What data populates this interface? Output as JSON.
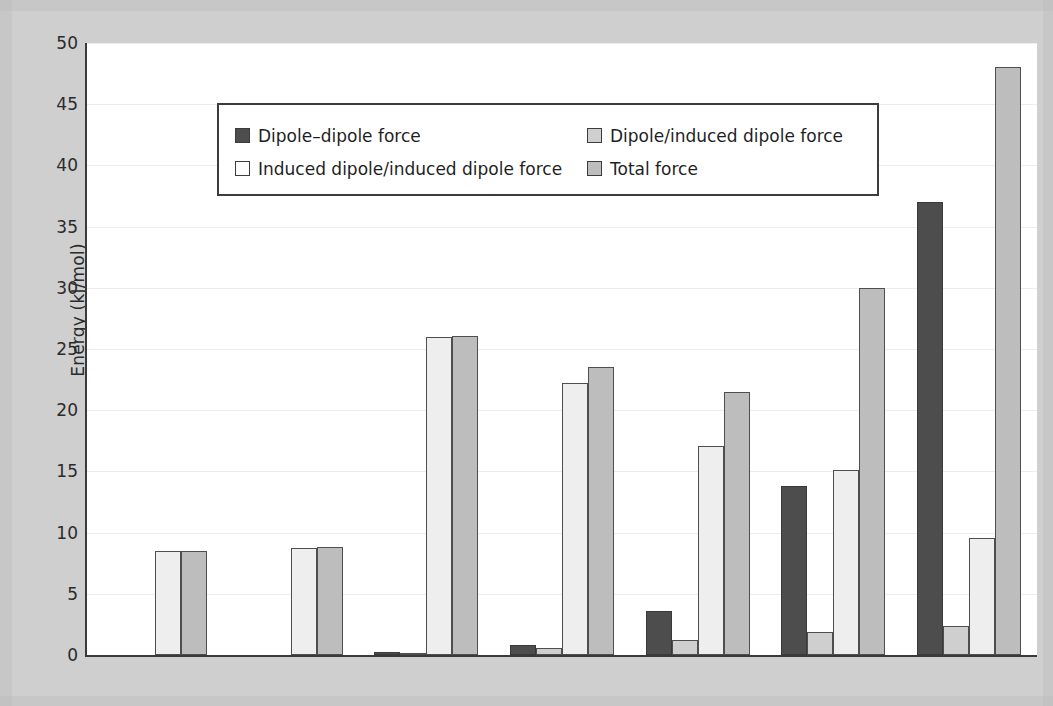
{
  "chart_data": {
    "type": "bar",
    "title": "",
    "xlabel": "",
    "ylabel": "Energy (kJ/mol)",
    "ylim": [
      0,
      50
    ],
    "ytick_step": 5,
    "yticks": [
      0,
      5,
      10,
      15,
      20,
      25,
      30,
      35,
      40,
      45,
      50
    ],
    "ytick_labels": [
      "0",
      "5",
      "10",
      "15",
      "20",
      "25",
      "30",
      "35",
      "40",
      "45",
      "50"
    ],
    "grid": true,
    "grid_axis": "y",
    "legend_position": "upper left",
    "categories": [
      "Ar",
      "CO",
      "HI",
      "HBr",
      "HCl",
      "NH3",
      "H2O"
    ],
    "category_labels_html": [
      "Ar",
      "CO",
      "HI",
      "HBr",
      "HCl",
      "NH<sub>3</sub>",
      "H<sub>2</sub>O"
    ],
    "series": [
      {
        "name": "Dipole–dipole force",
        "color": "#4d4d4d",
        "values": [
          null,
          null,
          0.1,
          0.8,
          3.6,
          13.8,
          37.0
        ]
      },
      {
        "name": "Dipole/induced dipole force",
        "color": "#cfcfcf",
        "values": [
          null,
          null,
          0.0,
          0.6,
          1.2,
          1.9,
          2.4
        ]
      },
      {
        "name": "Induced dipole/induced dipole force",
        "color": "#fdfdfd",
        "values": [
          8.5,
          8.75,
          26.0,
          22.2,
          17.1,
          15.1,
          9.6
        ]
      },
      {
        "name": "Total force",
        "color": "#bdbdbd",
        "values": [
          8.5,
          8.8,
          26.1,
          23.5,
          21.5,
          30.0,
          48.0
        ]
      }
    ]
  },
  "legend": {
    "entries": [
      {
        "label": "Dipole–dipole force",
        "swatch": "s0"
      },
      {
        "label": "Dipole/induced dipole force",
        "swatch": "s1"
      },
      {
        "label": "Induced dipole/induced dipole force",
        "swatch": "s2"
      },
      {
        "label": "Total force",
        "swatch": "s3"
      }
    ]
  },
  "colors": {
    "background": "#cfcfcf",
    "plot_background": "#ffffff",
    "axis": "#3a3a3a",
    "gridline": "#ededed",
    "text": "#2b2b2b"
  }
}
